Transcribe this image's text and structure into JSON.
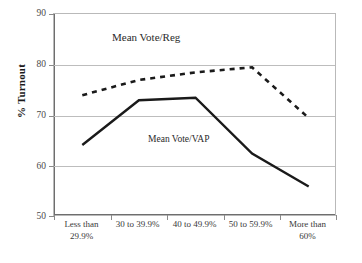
{
  "chart_data": {
    "type": "line",
    "title": "",
    "xlabel": "",
    "ylabel": "% Turnout",
    "ylim": [
      50,
      90
    ],
    "yticks": [
      50,
      60,
      70,
      80,
      90
    ],
    "grid": true,
    "legend_position": "inline-annotation",
    "categories": [
      "Less than\n29.9%",
      "30 to 39.9%",
      "40 to 49.9%",
      "50 to 59.9%",
      "More than\n60%"
    ],
    "series": [
      {
        "name": "Mean Vote/Reg",
        "style": "dashed",
        "color": "#1a1a1a",
        "values": [
          74,
          77,
          78.5,
          79.5,
          69.5
        ]
      },
      {
        "name": "Mean Vote/VAP",
        "style": "solid",
        "color": "#1a1a1a",
        "values": [
          64.2,
          73,
          73.5,
          62.5,
          56
        ]
      }
    ],
    "annotations": [
      {
        "text": "Mean Vote/Reg",
        "series": "Mean Vote/Reg"
      },
      {
        "text": "Mean Vote/VAP",
        "series": "Mean Vote/VAP"
      }
    ]
  },
  "axis": {
    "y_title": "% Turnout",
    "y_tick_labels": [
      "90",
      "80",
      "70",
      "60",
      "50"
    ],
    "x_tick_labels": [
      "Less than\n29.9%",
      "30 to 39.9%",
      "40 to 49.9%",
      "50 to 59.9%",
      "More than\n60%"
    ]
  },
  "labels": {
    "series_reg": "Mean Vote/Reg",
    "series_vap": "Mean Vote/VAP"
  }
}
